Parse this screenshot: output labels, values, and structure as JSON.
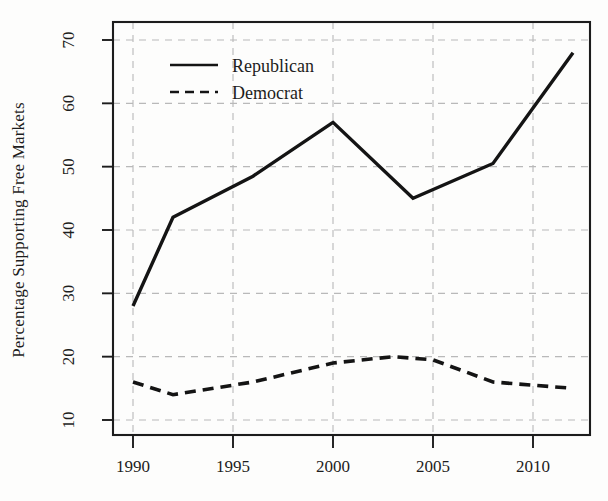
{
  "chart_data": {
    "type": "line",
    "title": "",
    "xlabel": "",
    "ylabel": "Percentage Supporting Free Markets",
    "xlim": [
      1989,
      1012.9
    ],
    "x_range": [
      1989.0,
      1012.9
    ],
    "ylim": [
      7,
      73
    ],
    "grid": true,
    "grid_style": "dashed",
    "legend_position": "top-left-inside",
    "x_ticks": [
      "1990",
      "1995",
      "2000",
      "2005",
      "2010"
    ],
    "x_tick_values": [
      1990,
      1995,
      2000,
      2005,
      2010
    ],
    "y_ticks": [
      "10",
      "20",
      "30",
      "40",
      "50",
      "60",
      "70"
    ],
    "y_tick_values": [
      10,
      20,
      30,
      40,
      50,
      60,
      70
    ],
    "series": [
      {
        "name": "Republican",
        "style": "solid",
        "color": "#141414",
        "x": [
          1990,
          1992,
          1996,
          2000,
          2004,
          2008,
          2012
        ],
        "values": [
          28,
          42,
          48.5,
          57,
          45,
          50.5,
          68
        ]
      },
      {
        "name": "Democrat",
        "style": "dashed",
        "color": "#141414",
        "x": [
          1990,
          1992,
          1996,
          2000,
          2003,
          2005,
          2008,
          2012
        ],
        "values": [
          16,
          14,
          16,
          19,
          20,
          19.5,
          16,
          15
        ]
      }
    ]
  },
  "legend": {
    "entries": [
      {
        "label": "Republican",
        "style": "solid"
      },
      {
        "label": "Democrat",
        "style": "dashed"
      }
    ]
  },
  "axes": {
    "y_axis_title": "Percentage Supporting Free Markets",
    "x_axis_title": ""
  },
  "colors": {
    "line": "#141414",
    "frame": "#1c1c1c",
    "grid": "#b9b9b9",
    "background": "#fdfdfc",
    "text": "#1d1d1d"
  }
}
